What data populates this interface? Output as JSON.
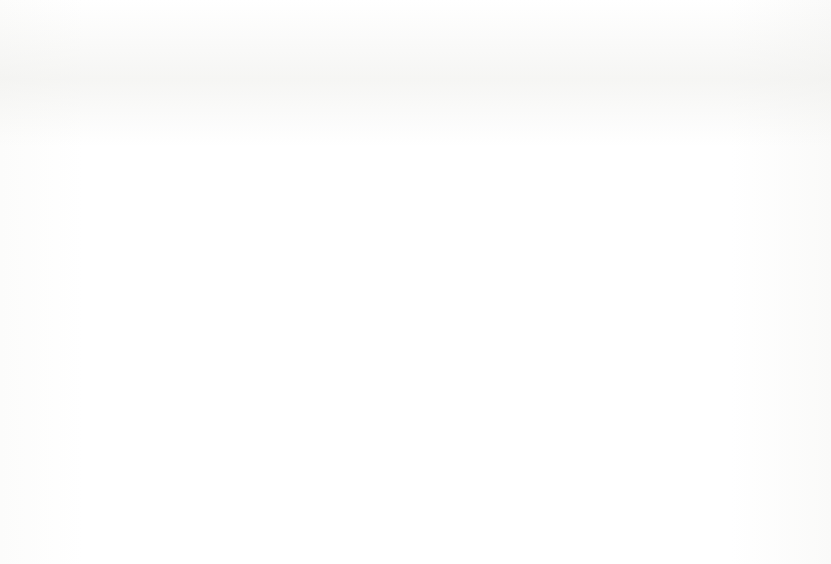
{
  "caption": {
    "number": "ure 12.5:",
    "text": "Current rates for fittings."
  },
  "legend": {
    "position": "right",
    "items": [
      {
        "label": "Landfill",
        "swatch": "black-solid-square-icon",
        "color": "#0d0d0d"
      },
      {
        "label": "Recycle off site",
        "swatch": "white-dotted-square-icon",
        "color": "#ffffff"
      },
      {
        "label": "Recycle on site",
        "swatch": "black-dotted-square-icon",
        "color": "#101010"
      },
      {
        "label": "Reuse off site",
        "swatch": "vertical-hatch-square-icon",
        "color": "#ffffff"
      },
      {
        "label": "Reuse on site",
        "swatch": "horizontal-hatch-square-icon",
        "color": "#ffffff"
      }
    ]
  },
  "chart_data": {
    "type": "bar",
    "stacked": true,
    "stack_mode": "percent",
    "title": "",
    "xlabel": "",
    "ylabel": "",
    "ylim": [
      0,
      100
    ],
    "yticks": [
      "0%",
      "10%",
      "20%",
      "30%",
      "40%",
      "50%",
      "60%",
      "70%",
      "80%",
      "90%",
      "100%"
    ],
    "ytick_values": [
      0,
      10,
      20,
      30,
      40,
      50,
      60,
      70,
      80,
      90,
      100
    ],
    "grid": true,
    "grid_axis": "y",
    "categories": [
      "Doors",
      "Door hardware",
      "Mirrors",
      "Suspended ceilings",
      "Partition walls",
      "Joinery",
      "Workstations",
      "Glazed partitions",
      "Electrical fittings",
      "Balustrades"
    ],
    "series": [
      {
        "name": "Reuse on site",
        "values": [
          0,
          0,
          1,
          28,
          29,
          0,
          35,
          28,
          4,
          1
        ]
      },
      {
        "name": "Reuse off site",
        "values": [
          0,
          0,
          0,
          22,
          22,
          5,
          35,
          23,
          5,
          0
        ]
      },
      {
        "name": "Recycle on site",
        "values": [
          0,
          0,
          0,
          0,
          0,
          0,
          0,
          0,
          0,
          0
        ]
      },
      {
        "name": "Recycle off site",
        "values": [
          0,
          5,
          10,
          1,
          8,
          0,
          7,
          14,
          5,
          16
        ]
      },
      {
        "name": "Landfill",
        "values": [
          100,
          95,
          89,
          49,
          41,
          95,
          23,
          35,
          86,
          83
        ]
      }
    ]
  }
}
